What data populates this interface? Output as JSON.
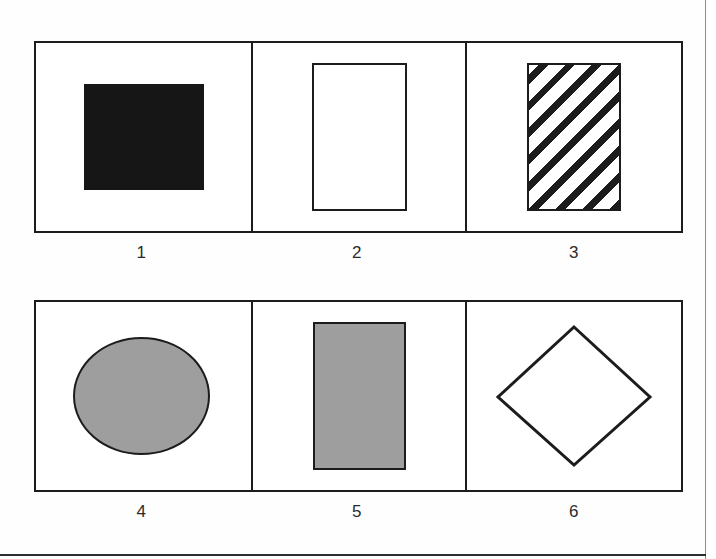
{
  "figure": {
    "caption_numbers_visible": true,
    "colors": {
      "ink": "#1c1c1c",
      "solid_fill": "#161616",
      "gray_fill": "#9e9e9e",
      "paper": "#ffffff",
      "page_edge": "#8d8d8d"
    },
    "rows": [
      {
        "row_index": 1,
        "cells": [
          {
            "label": "1",
            "shape": "square",
            "fill": "solid-black",
            "outline": "none",
            "icon_name": "solid-black-square-icon"
          },
          {
            "label": "2",
            "shape": "rectangle",
            "fill": "none",
            "outline": "black",
            "icon_name": "hollow-rectangle-icon"
          },
          {
            "label": "3",
            "shape": "rectangle",
            "fill": "diagonal-hatch",
            "outline": "black",
            "icon_name": "hatched-rectangle-icon"
          }
        ]
      },
      {
        "row_index": 2,
        "cells": [
          {
            "label": "4",
            "shape": "ellipse",
            "fill": "gray",
            "outline": "black",
            "icon_name": "gray-ellipse-icon"
          },
          {
            "label": "5",
            "shape": "rectangle",
            "fill": "gray",
            "outline": "black",
            "icon_name": "gray-rectangle-icon"
          },
          {
            "label": "6",
            "shape": "diamond",
            "fill": "none",
            "outline": "black",
            "icon_name": "hollow-diamond-icon"
          }
        ]
      }
    ]
  }
}
